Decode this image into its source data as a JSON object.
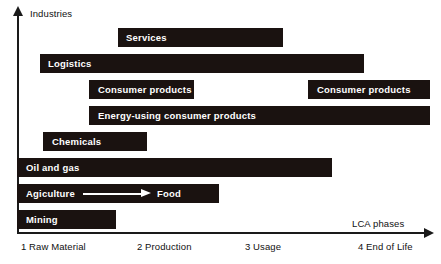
{
  "chart_data": {
    "type": "bar",
    "title": "",
    "xlabel": "LCA phases",
    "ylabel": "Industries",
    "orientation": "horizontal-gantt",
    "grid": false,
    "legend": "none",
    "x_axis": {
      "label": "LCA phases",
      "ticks": [
        {
          "index": 1,
          "label": "1 Raw Material",
          "x_px": 21
        },
        {
          "index": 2,
          "label": "2 Production",
          "x_px": 137
        },
        {
          "index": 3,
          "label": "3 Usage",
          "x_px": 245
        },
        {
          "index": 4,
          "label": "4 End of Life",
          "x_px": 358
        }
      ],
      "range_px": [
        17,
        432
      ]
    },
    "y_axis": {
      "label": "Industries",
      "categories": [
        "Services",
        "Logistics",
        "Consumer products",
        "Energy-using consumer products",
        "Chemicals",
        "Oil and gas",
        "Agiculture",
        "Mining"
      ]
    },
    "bars": [
      {
        "id": "services",
        "label": "Services",
        "row": 0,
        "top_px": 28,
        "left_px": 118,
        "width_px": 165,
        "phase_start": 2,
        "phase_end": 3.2
      },
      {
        "id": "logistics",
        "label": "Logistics",
        "row": 1,
        "top_px": 54,
        "left_px": 40,
        "width_px": 324,
        "phase_start": 1.2,
        "phase_end": 4.0
      },
      {
        "id": "consumer-products-production",
        "label": "Consumer products",
        "row": 2,
        "top_px": 80,
        "left_px": 89,
        "width_px": 105,
        "phase_start": 1.6,
        "phase_end": 2.6
      },
      {
        "id": "consumer-products-end-of-life",
        "label": "Consumer products",
        "row": 2,
        "top_px": 80,
        "left_px": 308,
        "width_px": 122,
        "phase_start": 3.6,
        "phase_end": 4.6
      },
      {
        "id": "energy-using-consumer-products",
        "label": "Energy-using consumer products",
        "row": 3,
        "top_px": 106,
        "left_px": 89,
        "width_px": 341,
        "phase_start": 1.6,
        "phase_end": 4.6
      },
      {
        "id": "chemicals",
        "label": "Chemicals",
        "row": 4,
        "top_px": 132,
        "left_px": 43,
        "width_px": 104,
        "phase_start": 1.25,
        "phase_end": 2.2
      },
      {
        "id": "oil-and-gas",
        "label": "Oil and gas",
        "row": 5,
        "top_px": 158,
        "left_px": 17,
        "width_px": 315,
        "phase_start": 1.0,
        "phase_end": 3.8
      },
      {
        "id": "agiculture-food",
        "label": "Agiculture",
        "label_secondary": "Food",
        "has_arrow": true,
        "row": 6,
        "top_px": 184,
        "left_px": 17,
        "width_px": 202,
        "phase_start": 1.0,
        "phase_end": 2.8
      },
      {
        "id": "mining",
        "label": "Mining",
        "row": 7,
        "top_px": 210,
        "left_px": 17,
        "width_px": 99,
        "phase_start": 1.0,
        "phase_end": 1.9
      }
    ],
    "colors": {
      "bar_fill": "#1a1210",
      "bar_text": "#ffffff",
      "axis": "#1a1a1a",
      "background": "#ffffff",
      "tick_text": "#111111"
    }
  }
}
